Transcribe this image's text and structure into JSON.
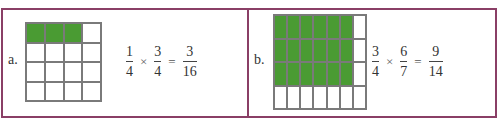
{
  "colors": {
    "border": "#8a3f66",
    "shaded": "#4a9b33",
    "gridline": "#7a7a7a"
  },
  "panels": [
    {
      "label": "a.",
      "grid": {
        "rows": 4,
        "cols": 4,
        "shaded_rows": 1,
        "shaded_cols": 3
      },
      "equation": {
        "factor1": {
          "num": "1",
          "den": "4"
        },
        "operator": "×",
        "factor2": {
          "num": "3",
          "den": "4"
        },
        "equals": "=",
        "result": {
          "num": "3",
          "den": "16"
        }
      }
    },
    {
      "label": "b.",
      "grid": {
        "rows": 4,
        "cols": 7,
        "shaded_rows": 3,
        "shaded_cols": 6
      },
      "equation": {
        "factor1": {
          "num": "3",
          "den": "4"
        },
        "operator": "×",
        "factor2": {
          "num": "6",
          "den": "7"
        },
        "equals": "=",
        "result": {
          "num": "9",
          "den": "14"
        }
      }
    }
  ]
}
